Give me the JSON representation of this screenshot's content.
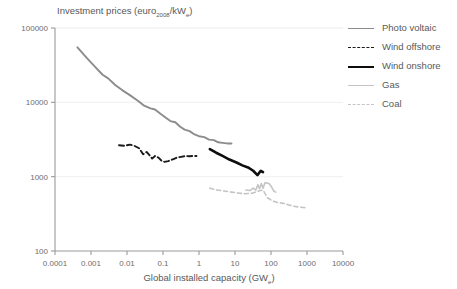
{
  "chart_data": {
    "type": "line",
    "title": "",
    "ylabel": "Investment prices (euro2008/kWe)",
    "ylabel_main": "Investment prices (euro",
    "ylabel_sub": "2008",
    "ylabel_tail": "/kW",
    "ylabel_sub2": "e",
    "ylabel_end": ")",
    "xlabel": "Global installed capacity (GWe)",
    "xlabel_main": "Global installed capacity (GW",
    "xlabel_sub": "e",
    "xlabel_end": ")",
    "xscale": "log",
    "yscale": "log",
    "xlim": [
      0.0001,
      10000
    ],
    "ylim": [
      100,
      100000
    ],
    "grid": true,
    "legend_position": "right",
    "xticks": [
      "0.0001",
      "0.001",
      "0.01",
      "0.1",
      "1",
      "10",
      "100",
      "1000",
      "10000"
    ],
    "xtick_values": [
      0.0001,
      0.001,
      0.01,
      0.1,
      1,
      10,
      100,
      1000,
      10000
    ],
    "yticks": [
      "100000",
      "10000",
      "1000",
      "100"
    ],
    "ytick_values": [
      100000,
      10000,
      1000,
      100
    ],
    "series": [
      {
        "name": "Photo voltaic",
        "color": "#8c8c8e",
        "style": "solid",
        "width": 1.9,
        "points": [
          [
            0.00042,
            55000
          ],
          [
            0.00075,
            40000
          ],
          [
            0.0013,
            30000
          ],
          [
            0.0021,
            23500
          ],
          [
            0.003,
            21000
          ],
          [
            0.0048,
            17000
          ],
          [
            0.0075,
            14500
          ],
          [
            0.012,
            12500
          ],
          [
            0.02,
            10500
          ],
          [
            0.03,
            9000
          ],
          [
            0.045,
            8300
          ],
          [
            0.06,
            8000
          ],
          [
            0.085,
            7000
          ],
          [
            0.12,
            6200
          ],
          [
            0.16,
            5600
          ],
          [
            0.22,
            5400
          ],
          [
            0.3,
            4700
          ],
          [
            0.4,
            4300
          ],
          [
            0.55,
            4100
          ],
          [
            0.75,
            3700
          ],
          [
            1.0,
            3500
          ],
          [
            1.4,
            3400
          ],
          [
            1.9,
            3150
          ],
          [
            2.6,
            3100
          ],
          [
            3.4,
            2900
          ],
          [
            4.5,
            2850
          ],
          [
            6.0,
            2800
          ],
          [
            8.0,
            2800
          ]
        ]
      },
      {
        "name": "Wind offshore",
        "color": "#1a1a1a",
        "style": "dashed",
        "width": 1.9,
        "points": [
          [
            0.006,
            2650
          ],
          [
            0.0085,
            2600
          ],
          [
            0.012,
            2700
          ],
          [
            0.016,
            2600
          ],
          [
            0.022,
            2400
          ],
          [
            0.028,
            2000
          ],
          [
            0.035,
            2150
          ],
          [
            0.042,
            1950
          ],
          [
            0.05,
            1750
          ],
          [
            0.06,
            1900
          ],
          [
            0.075,
            1800
          ],
          [
            0.09,
            1650
          ],
          [
            0.11,
            1580
          ],
          [
            0.14,
            1620
          ],
          [
            0.18,
            1700
          ],
          [
            0.24,
            1800
          ],
          [
            0.32,
            1850
          ],
          [
            0.42,
            1900
          ],
          [
            0.55,
            1880
          ],
          [
            0.7,
            1900
          ],
          [
            0.85,
            1900
          ]
        ]
      },
      {
        "name": "Wind onshore",
        "color": "#0d0d0d",
        "style": "solid",
        "width": 2.6,
        "points": [
          [
            2.0,
            2350
          ],
          [
            3.0,
            2100
          ],
          [
            4.5,
            1900
          ],
          [
            7.0,
            1700
          ],
          [
            11.0,
            1550
          ],
          [
            16.0,
            1420
          ],
          [
            23.0,
            1330
          ],
          [
            32.0,
            1200
          ],
          [
            42.0,
            1050
          ],
          [
            52.0,
            1200
          ],
          [
            60.0,
            1150
          ]
        ]
      },
      {
        "name": "Gas",
        "color": "#c4c4c6",
        "style": "solid",
        "width": 1.6,
        "points": [
          [
            20.0,
            660
          ],
          [
            26.0,
            650
          ],
          [
            32.0,
            700
          ],
          [
            38.0,
            660
          ],
          [
            43.0,
            780
          ],
          [
            48.0,
            690
          ],
          [
            54.0,
            810
          ],
          [
            60.0,
            700
          ],
          [
            68.0,
            830
          ],
          [
            78.0,
            820
          ],
          [
            90.0,
            800
          ],
          [
            105.0,
            720
          ],
          [
            120.0,
            640
          ],
          [
            135.0,
            620
          ]
        ]
      },
      {
        "name": "Coal",
        "color": "#c4c4c6",
        "style": "dashed",
        "width": 1.6,
        "points": [
          [
            2.0,
            700
          ],
          [
            3.2,
            660
          ],
          [
            5.0,
            640
          ],
          [
            8.0,
            620
          ],
          [
            13.0,
            600
          ],
          [
            20.0,
            590
          ],
          [
            30.0,
            600
          ],
          [
            45.0,
            640
          ],
          [
            60.0,
            660
          ],
          [
            80.0,
            520
          ],
          [
            110.0,
            470
          ],
          [
            150.0,
            450
          ],
          [
            210.0,
            440
          ],
          [
            300.0,
            420
          ],
          [
            420.0,
            400
          ],
          [
            600.0,
            390
          ],
          [
            800.0,
            385
          ],
          [
            1000.0,
            380
          ]
        ]
      }
    ]
  },
  "legend": {
    "items": [
      {
        "label": "Photo voltaic"
      },
      {
        "label": "Wind offshore"
      },
      {
        "label": "Wind onshore"
      },
      {
        "label": "Gas"
      },
      {
        "label": "Coal"
      }
    ]
  },
  "colors": {
    "background": "#ffffff",
    "axis": "#9a9a9c",
    "grid": "#f2f2f4",
    "text": "#58585a",
    "photovoltaic": "#8c8c8e",
    "wind_offshore": "#1a1a1a",
    "wind_onshore": "#0d0d0d",
    "gas": "#c4c4c6",
    "coal": "#c4c4c6"
  }
}
